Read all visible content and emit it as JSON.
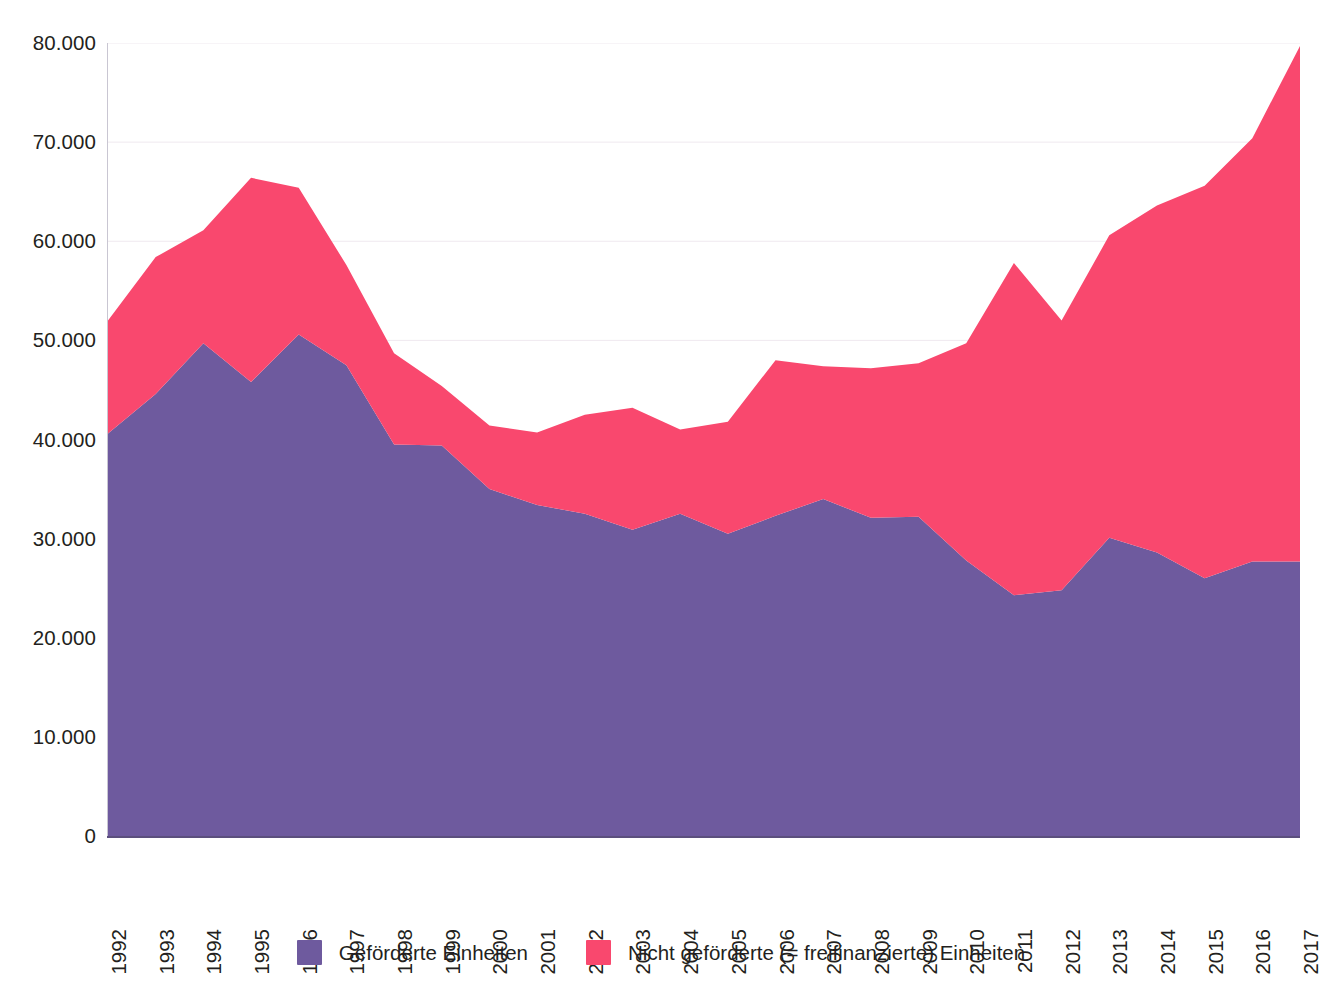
{
  "chart_data": {
    "type": "area",
    "stacked": true,
    "title": "",
    "subtitle": "",
    "xlabel": "",
    "ylabel": "",
    "grid": true,
    "legend_position": "bottom",
    "ylim": [
      0,
      80000
    ],
    "ytick_values": [
      0,
      10000,
      20000,
      30000,
      40000,
      50000,
      60000,
      70000,
      80000
    ],
    "ytick_labels": [
      "0",
      "10.000",
      "20.000",
      "30.000",
      "40.000",
      "50.000",
      "60.000",
      "70.000",
      "80.000"
    ],
    "categories": [
      "1992",
      "1993",
      "1994",
      "1995",
      "1996",
      "1997",
      "1998",
      "1999",
      "2000",
      "2001",
      "2002",
      "2003",
      "2004",
      "2005",
      "2006",
      "2007",
      "2008",
      "2009",
      "2010",
      "2011",
      "2012",
      "2013",
      "2014",
      "2015",
      "2016",
      "2017"
    ],
    "series": [
      {
        "name": "Geförderte Einheiten",
        "color": "#6E5A9E",
        "values": [
          40600,
          44600,
          49700,
          45800,
          50600,
          47500,
          39500,
          39400,
          35000,
          33400,
          32500,
          30900,
          32500,
          30500,
          32300,
          34000,
          32100,
          32200,
          27800,
          24300,
          24800,
          30100,
          28600,
          26000,
          27700,
          27700
        ]
      },
      {
        "name": "Nicht geförderte (= freifinanzierte) Einheiten",
        "color": "#F9486E",
        "values": [
          11400,
          13800,
          11400,
          20600,
          14800,
          10100,
          9200,
          6000,
          6400,
          7300,
          10000,
          12300,
          8500,
          11300,
          15700,
          13400,
          15100,
          15500,
          21900,
          33500,
          27200,
          30500,
          35000,
          39600,
          42700,
          52000
        ]
      }
    ],
    "totals": [
      52000,
      58400,
      61100,
      66400,
      65400,
      57600,
      48700,
      45400,
      41400,
      40700,
      42500,
      43200,
      41000,
      41800,
      48000,
      47400,
      47200,
      47700,
      49700,
      57800,
      52000,
      60600,
      63600,
      65600,
      70400,
      79700
    ]
  },
  "legend": {
    "items": [
      {
        "label": "Geförderte Einheiten",
        "color": "#6E5A9E"
      },
      {
        "label": "Nicht geförderte (= freifinanzierte) Einheiten",
        "color": "#F9486E"
      }
    ]
  },
  "colors": {
    "foerdert": "#6E5A9E",
    "frei": "#F9486E",
    "grid": "#efe9ef",
    "axis": "#5b4f7d",
    "text": "#231f20",
    "background": "#ffffff"
  }
}
